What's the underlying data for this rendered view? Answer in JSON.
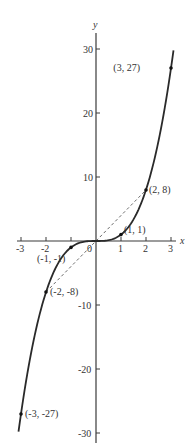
{
  "chart_data": {
    "type": "line",
    "title": "",
    "function": "y = x^3",
    "xlabel": "x",
    "ylabel": "y",
    "xlim": [
      -3.2,
      3.2
    ],
    "ylim": [
      -31,
      32
    ],
    "grid": false,
    "x_ticks": [
      -3,
      -2,
      -1,
      0,
      1,
      2,
      3
    ],
    "x_tick_labels": [
      "-3",
      "-2",
      "",
      "0",
      "1",
      "2",
      "3"
    ],
    "y_ticks": [
      30,
      20,
      10,
      -10,
      -20,
      -30
    ],
    "y_tick_labels": [
      "30",
      "20",
      "10",
      "-10",
      "-20",
      "-30"
    ],
    "series": [
      {
        "name": "y = x^3",
        "style": "solid",
        "x": [
          -3.1,
          -3,
          -2.5,
          -2,
          -1.5,
          -1,
          -0.5,
          0,
          0.5,
          1,
          1.5,
          2,
          2.5,
          3,
          3.1
        ],
        "y": [
          -29.79,
          -27,
          -15.63,
          -8,
          -3.38,
          -1,
          -0.13,
          0,
          0.13,
          1,
          3.38,
          8,
          15.63,
          27,
          29.79
        ]
      },
      {
        "name": "chord (-2,-8) to (2,8)",
        "style": "dashed",
        "x": [
          -2,
          0,
          2
        ],
        "y": [
          -8,
          0,
          8
        ]
      }
    ],
    "points": [
      {
        "x": 3,
        "y": 27,
        "label": "(3, 27)"
      },
      {
        "x": 2,
        "y": 8,
        "label": "(2, 8)"
      },
      {
        "x": 1,
        "y": 1,
        "label": "(1, 1)"
      },
      {
        "x": -1,
        "y": -1,
        "label": "(-1, -1)"
      },
      {
        "x": -2,
        "y": -8,
        "label": "(-2, -8)"
      },
      {
        "x": -3,
        "y": -27,
        "label": "(-3, -27)"
      }
    ]
  },
  "labels": {
    "x_axis": "x",
    "y_axis": "y",
    "ticks": {
      "xm3": "-3",
      "xm2": "-2",
      "x0": "0",
      "x1": "1",
      "x2": "2",
      "x3": "3",
      "y30": "30",
      "y20": "20",
      "y10": "10",
      "ym10": "-10",
      "ym20": "-20",
      "ym30": "-30"
    },
    "points": {
      "p3": "(3, 27)",
      "p2": "(2, 8)",
      "p1": "(1, 1)",
      "pm1": "(-1, -1)",
      "pm2": "(-2, -8)",
      "pm3": "(-3, -27)"
    }
  }
}
